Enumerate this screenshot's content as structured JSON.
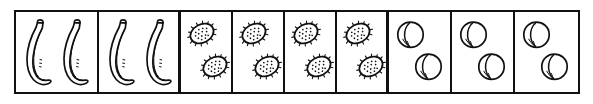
{
  "worksheet": {
    "title": "Fruit grouping array",
    "description": "A single row of nine bordered boxes, each containing two identical fruits.",
    "stroke_color": "#111111",
    "background_color": "#ffffff",
    "total_cells": 9,
    "fruits_per_cell": 2,
    "total_fruits": 18,
    "groups": [
      {
        "fruit": "banana",
        "cell_count": 2,
        "fruits_per_cell": 2,
        "subtotal": 4
      },
      {
        "fruit": "kiwi",
        "cell_count": 4,
        "fruits_per_cell": 2,
        "subtotal": 8
      },
      {
        "fruit": "peach",
        "cell_count": 3,
        "fruits_per_cell": 2,
        "subtotal": 6
      }
    ],
    "cells": [
      {
        "index": 1,
        "fruit": "banana",
        "count": 2,
        "icon": "banana-icon"
      },
      {
        "index": 2,
        "fruit": "banana",
        "count": 2,
        "icon": "banana-icon"
      },
      {
        "index": 3,
        "fruit": "kiwi",
        "count": 2,
        "icon": "kiwi-icon"
      },
      {
        "index": 4,
        "fruit": "kiwi",
        "count": 2,
        "icon": "kiwi-icon"
      },
      {
        "index": 5,
        "fruit": "kiwi",
        "count": 2,
        "icon": "kiwi-icon"
      },
      {
        "index": 6,
        "fruit": "kiwi",
        "count": 2,
        "icon": "kiwi-icon"
      },
      {
        "index": 7,
        "fruit": "peach",
        "count": 2,
        "icon": "peach-icon"
      },
      {
        "index": 8,
        "fruit": "peach",
        "count": 2,
        "icon": "peach-icon"
      },
      {
        "index": 9,
        "fruit": "peach",
        "count": 2,
        "icon": "peach-icon"
      }
    ]
  }
}
